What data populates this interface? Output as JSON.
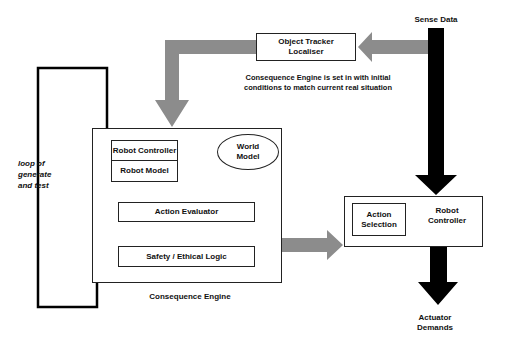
{
  "diagram": {
    "sense_data": "Sense Data",
    "object_tracker": {
      "line1": "Object Tracker",
      "line2": "Localiser"
    },
    "init_note": {
      "line1": "Consequence Engine is set in with initial",
      "line2": "conditions to match current real situation"
    },
    "loop_label": {
      "line1": "loop of",
      "line2": "generate",
      "line3": "and test"
    },
    "robot_controller_inner": "Robot Controller",
    "robot_model": "Robot Model",
    "world_model": {
      "line1": "World",
      "line2": "Model"
    },
    "action_evaluator": "Action Evaluator",
    "safety_logic": "Safety / Ethical Logic",
    "consequence_engine": "Consequence Engine",
    "action_selection": {
      "line1": "Action",
      "line2": "Selection"
    },
    "robot_controller_outer": {
      "line1": "Robot",
      "line2": "Controller"
    },
    "actuator_demands": {
      "line1": "Actuator",
      "line2": "Demands"
    }
  }
}
